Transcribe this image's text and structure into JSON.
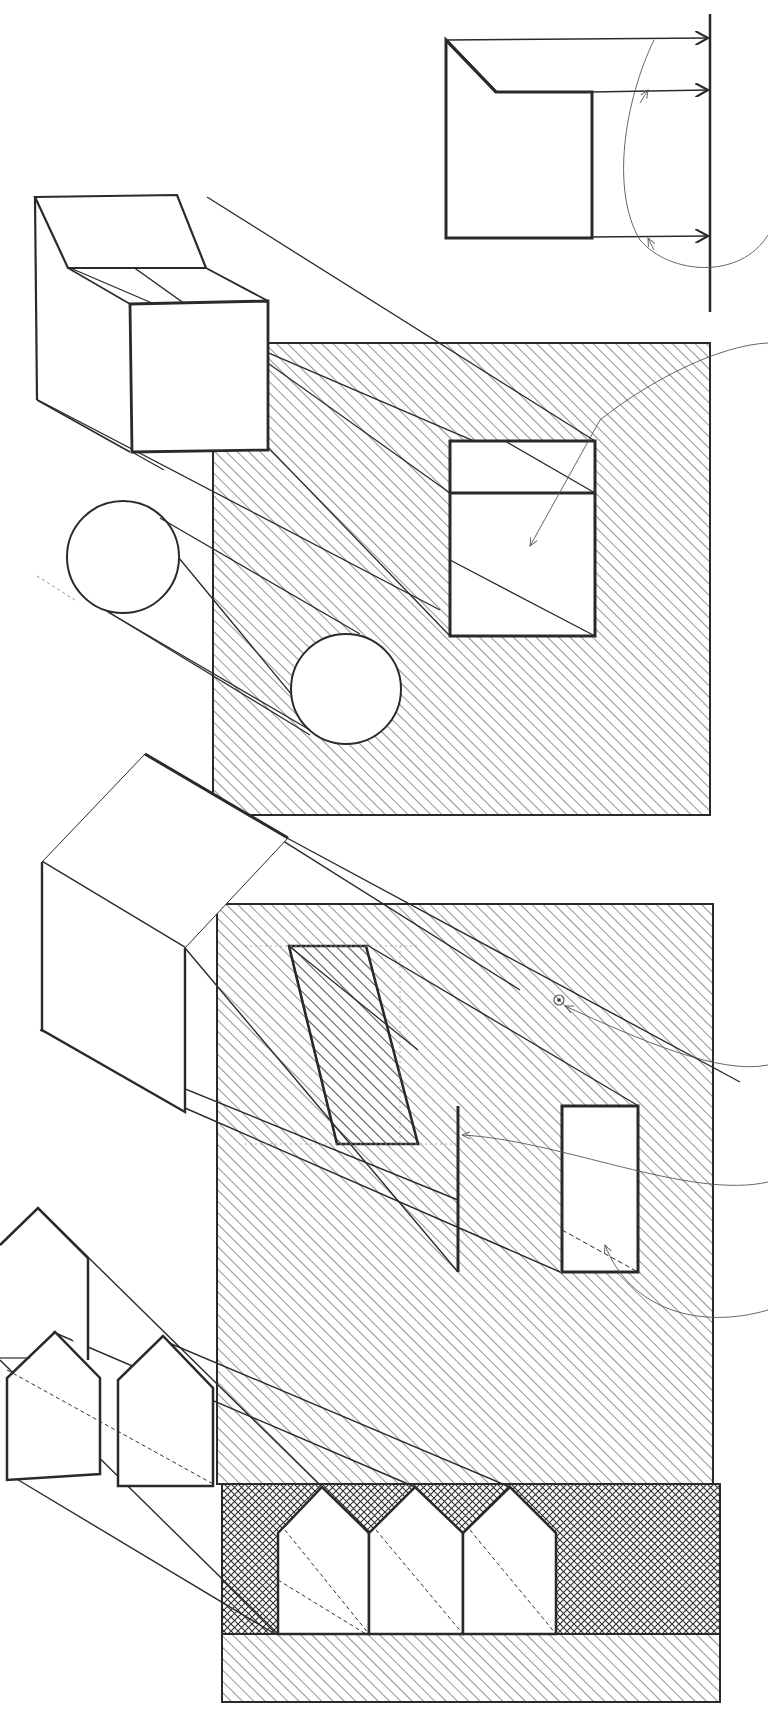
{
  "diagram": {
    "kind": "shadow-projection-sketch",
    "width": 768,
    "height": 1729,
    "colors": {
      "background": "#ffffff",
      "ink": "#2a2a2a",
      "hatch": "#3a3a3a",
      "construction": "#888888"
    },
    "labels": []
  },
  "panels": [
    {
      "id": "elevation-top",
      "description": "Orthographic elevation of stepped block with projection arrows to a vertical plane"
    },
    {
      "id": "panel-1",
      "description": "Block with sloped top and cylinder casting shadow onto hatched wall",
      "wall": {
        "x": 213,
        "y": 343,
        "w": 497,
        "h": 472
      }
    },
    {
      "id": "panel-2",
      "description": "Box with sloped roof casting shadow with trapezoidal and rectangular openings",
      "wall": {
        "x": 217,
        "y": 904,
        "w": 496,
        "h": 580
      }
    },
    {
      "id": "panel-3",
      "description": "Row of gabled house profiles casting cross-hatched shadow band",
      "band": {
        "x": 222,
        "y": 1484,
        "w": 498,
        "h": 150
      }
    }
  ]
}
